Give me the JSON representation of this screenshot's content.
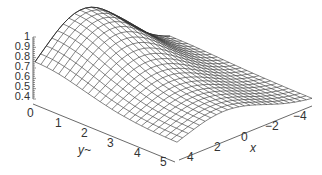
{
  "chart_data": {
    "type": "surface",
    "title": "",
    "xlabel": "x",
    "ylabel": "y~",
    "zlabel": "",
    "x_ticks": [
      "4",
      "2",
      "0",
      "−2",
      "−4"
    ],
    "y_ticks": [
      "0",
      "1",
      "2",
      "3",
      "4",
      "5"
    ],
    "z_ticks": [
      "1",
      "0.9",
      "0.8",
      "0.7",
      "0.6",
      "0.5",
      "0.4"
    ],
    "xlim": [
      -5,
      5
    ],
    "ylim": [
      0,
      5
    ],
    "zlim": [
      0.35,
      1.0
    ],
    "grid_resolution": 24,
    "surface_description": "Mesh surface peaking at z=1 near y=0, x≈2, decaying toward z≈0.4 as y increases and toward x edges",
    "mesh_color": "#333333",
    "grid": false,
    "legend": null
  },
  "z_tick_labels": [
    {
      "text": "1",
      "top": 31
    },
    {
      "text": "0.9",
      "top": 41
    },
    {
      "text": "0.8",
      "top": 51
    },
    {
      "text": "0.7",
      "top": 61
    },
    {
      "text": "0.6",
      "top": 71
    },
    {
      "text": "0.5",
      "top": 81
    },
    {
      "text": "0.4",
      "top": 91
    }
  ],
  "y_tick_labels": [
    {
      "text": "0",
      "left": 27,
      "top": 107
    },
    {
      "text": "1",
      "left": 55,
      "top": 117
    },
    {
      "text": "2",
      "left": 81,
      "top": 127
    },
    {
      "text": "3",
      "left": 107,
      "top": 137
    },
    {
      "text": "4",
      "left": 134,
      "top": 147
    },
    {
      "text": "5",
      "left": 160,
      "top": 156
    }
  ],
  "x_tick_labels": [
    {
      "text": "4",
      "left": 187,
      "top": 151
    },
    {
      "text": "2",
      "left": 214,
      "top": 141
    },
    {
      "text": "0",
      "left": 241,
      "top": 131
    },
    {
      "text": "−2",
      "left": 265,
      "top": 120
    },
    {
      "text": "−4",
      "left": 293,
      "top": 110
    }
  ],
  "axis_titles": {
    "y": {
      "text": "y~",
      "left": 78,
      "top": 144
    },
    "x": {
      "text": "x",
      "left": 250,
      "top": 142
    }
  }
}
